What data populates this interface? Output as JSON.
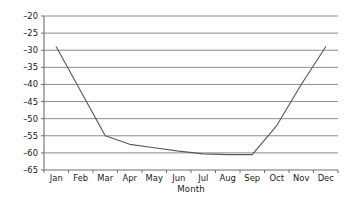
{
  "chart_data": {
    "type": "line",
    "title": "",
    "xlabel": "Month",
    "ylabel": "Temperature (deg C)",
    "categories": [
      "Jan",
      "Feb",
      "Mar",
      "Apr",
      "May",
      "Jun",
      "Jul",
      "Aug",
      "Sep",
      "Oct",
      "Nov",
      "Dec"
    ],
    "values": [
      -29,
      -42,
      -55,
      -57.5,
      -58.5,
      -59.5,
      -60.3,
      -60.5,
      -60.5,
      -52,
      -40,
      -29
    ],
    "ylim": [
      -65,
      -20
    ],
    "yticks": [
      -20,
      -25,
      -30,
      -35,
      -40,
      -45,
      -50,
      -55,
      -60,
      -65
    ],
    "ytick_labels": [
      "–20",
      "–25",
      "–30",
      "–35",
      "–40",
      "–45",
      "–50",
      "–55",
      "–60",
      "–65"
    ],
    "grid": true,
    "grid_axis": "y",
    "legend": false,
    "series_color": "#5a5a5a",
    "grid_color": "#8c8c8c",
    "axis_color": "#6e6e6e",
    "background": "#ffffff"
  }
}
